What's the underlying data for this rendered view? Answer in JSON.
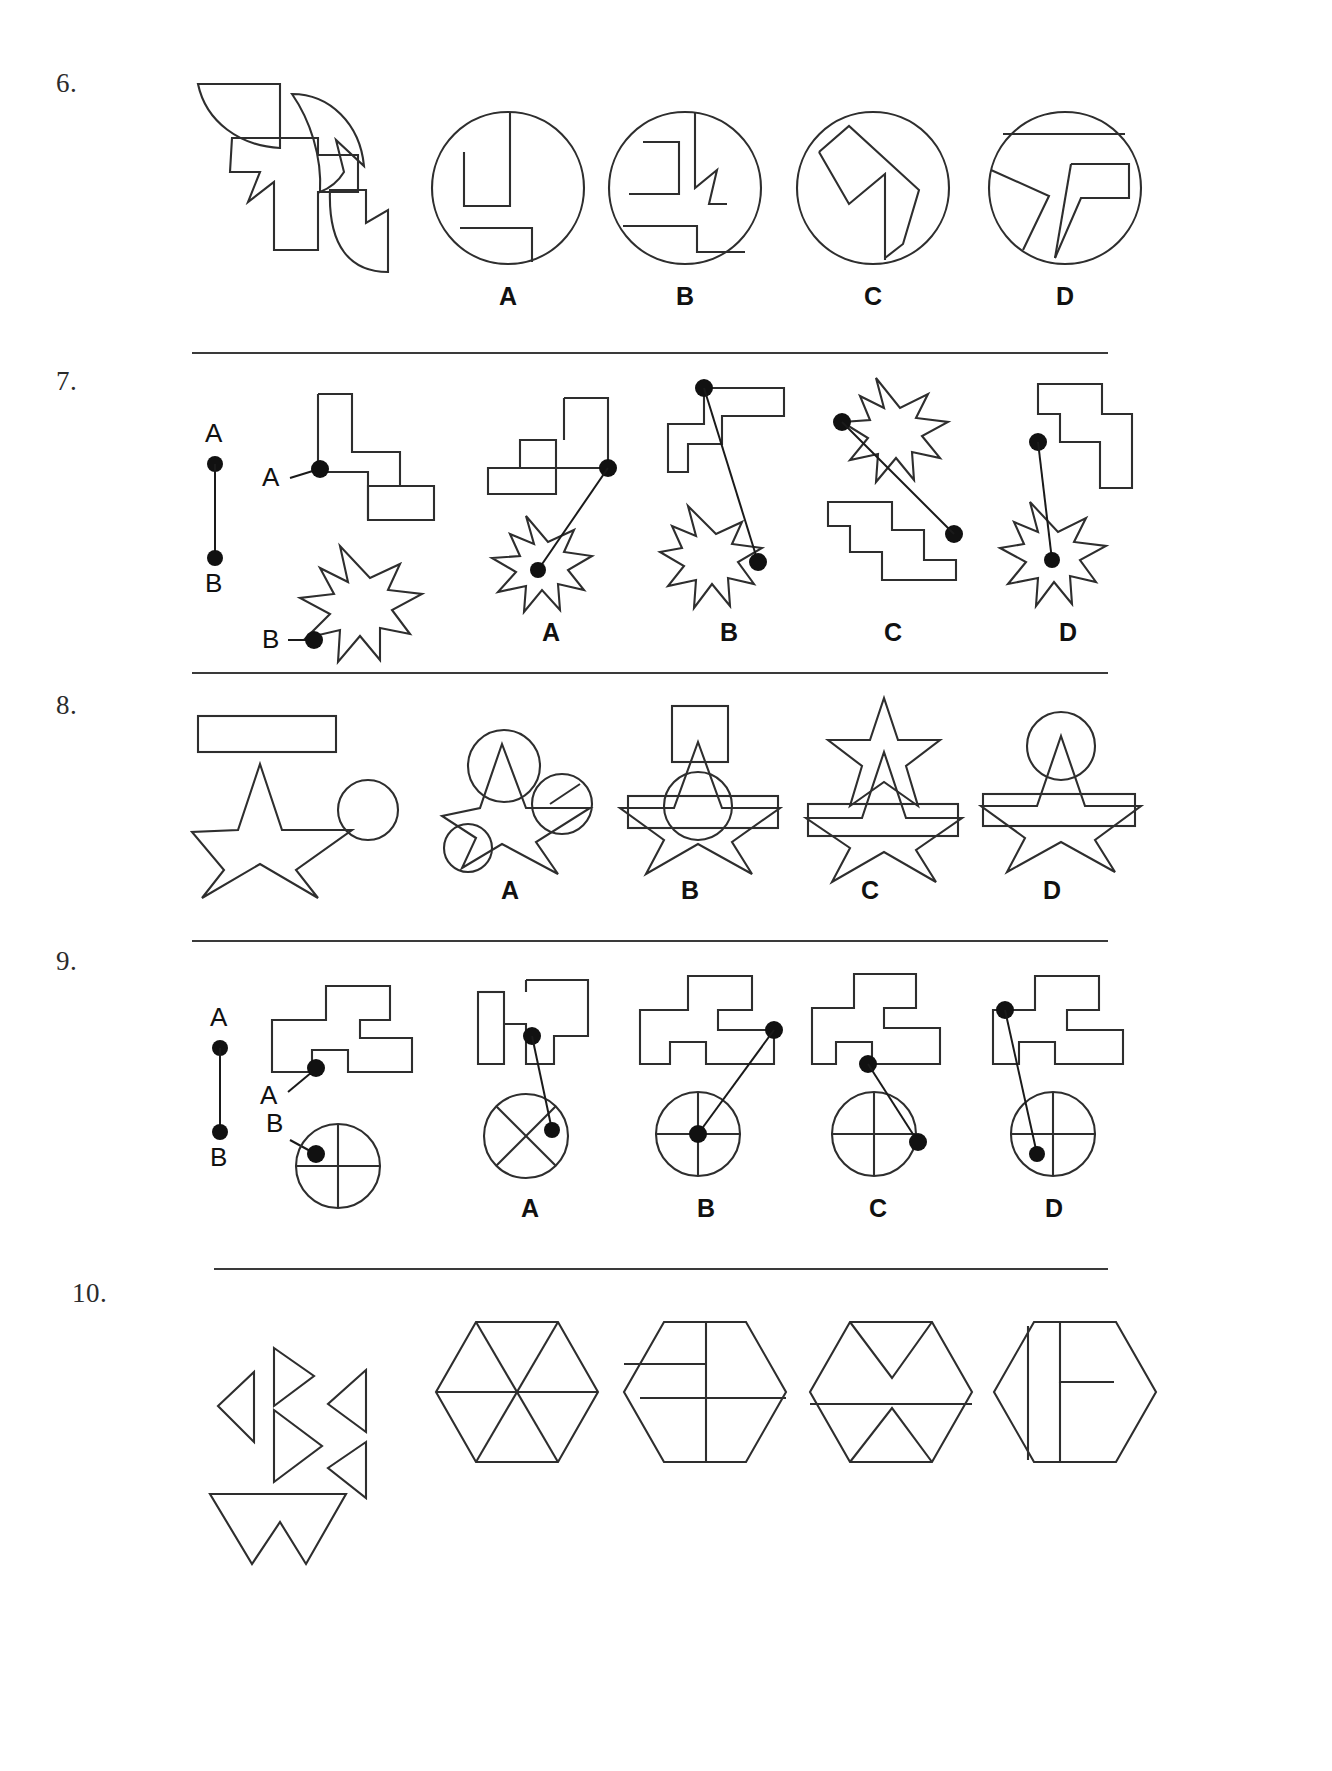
{
  "page": {
    "background_color": "#ffffff",
    "ink_color": "#2e2e2e"
  },
  "option_labels": [
    "A",
    "B",
    "C",
    "D"
  ],
  "point_labels": {
    "a": "A",
    "b": "B"
  },
  "questions": [
    {
      "number": "6.",
      "type": "shape-assembly-into-circle",
      "prompt_description": "Four line-art pieces: a quarter-disc wedge, a curved arrow-notched crescent, a large stepped cross polygon, and a notched quarter-disc",
      "options": [
        {
          "label": "A",
          "description": "Circle containing an upright rectangle block and a lower right-angled step"
        },
        {
          "label": "B",
          "description": "Circle containing a stepped zig-zag form with notched arrow and lower step"
        },
        {
          "label": "C",
          "description": "Circle containing a tall angular chevron / lightning band with vertical stem"
        },
        {
          "label": "D",
          "description": "Circle containing a slanted T-shaped band with horizontal chord at top"
        }
      ]
    },
    {
      "number": "7.",
      "type": "point-connection",
      "key_points": [
        "A",
        "B"
      ],
      "prompt_description": "Point A on a zig-zag stepped polygon and point B on a six-pointed star; key shows A above B joined by a vertical segment",
      "options": [
        {
          "label": "A",
          "description": "Staircase polygon with dot at upper right joined by line to dot at centre of six-pointed star below-left"
        },
        {
          "label": "B",
          "description": "Stepped polygon with dot at top left joined by line to dot at lower right edge of star"
        },
        {
          "label": "C",
          "description": "Six-pointed star upper-left with dot on its left point joined to dot on staircase polygon lower right"
        },
        {
          "label": "D",
          "description": "Stepped polygon with dot at its left joined by line to dot at centre of star below"
        }
      ]
    },
    {
      "number": "8.",
      "type": "shape-overlay",
      "prompt_description": "Three separate shapes: a wide thin rectangle, a five-pointed star, and a circle",
      "options": [
        {
          "label": "A",
          "description": "Star with circle overlapping its top point, a second circle at right, and a small circle at lower left"
        },
        {
          "label": "B",
          "description": "Star with square above top point, circle centred on star, rectangle band across the middle"
        },
        {
          "label": "C",
          "description": "Star with a smaller star above it and rectangle band across its middle"
        },
        {
          "label": "D",
          "description": "Star with circle at top point and rectangle band across its middle"
        }
      ]
    },
    {
      "number": "9.",
      "type": "point-connection",
      "key_points": [
        "A",
        "B"
      ],
      "prompt_description": "Point A on a stepped rectilinear block and point B on a circle divided by a cross; key shows A above B joined by a vertical segment",
      "options": [
        {
          "label": "A",
          "description": "Stepped block with dot at lower left joined to dot inside circle containing an X cross"
        },
        {
          "label": "B",
          "description": "Stepped block with dot at upper right joined to dot at centre of circle with upright cross"
        },
        {
          "label": "C",
          "description": "Stepped block with dot at lower left joined to dot at right side of circle with upright cross"
        },
        {
          "label": "D",
          "description": "Stepped block with dot at upper left joined to dot at lower left inside circle with upright cross"
        }
      ]
    },
    {
      "number": "10.",
      "type": "shape-assembly-into-hexagon",
      "prompt_description": "Five triangular and arrow-like line-art pieces forming a disassembled hexagon",
      "options": [
        {
          "label": "A",
          "description": "Hexagon divided into six triangles by three full diagonals"
        },
        {
          "label": "B",
          "description": "Hexagon divided by a vertical line and two horizontal stubs at left"
        },
        {
          "label": "C",
          "description": "Hexagon with zig-zag V shapes at top and bottom and a horizontal chord"
        },
        {
          "label": "D",
          "description": "Hexagon with a vertical line at left and an angular L-shaped form at centre"
        }
      ]
    }
  ]
}
